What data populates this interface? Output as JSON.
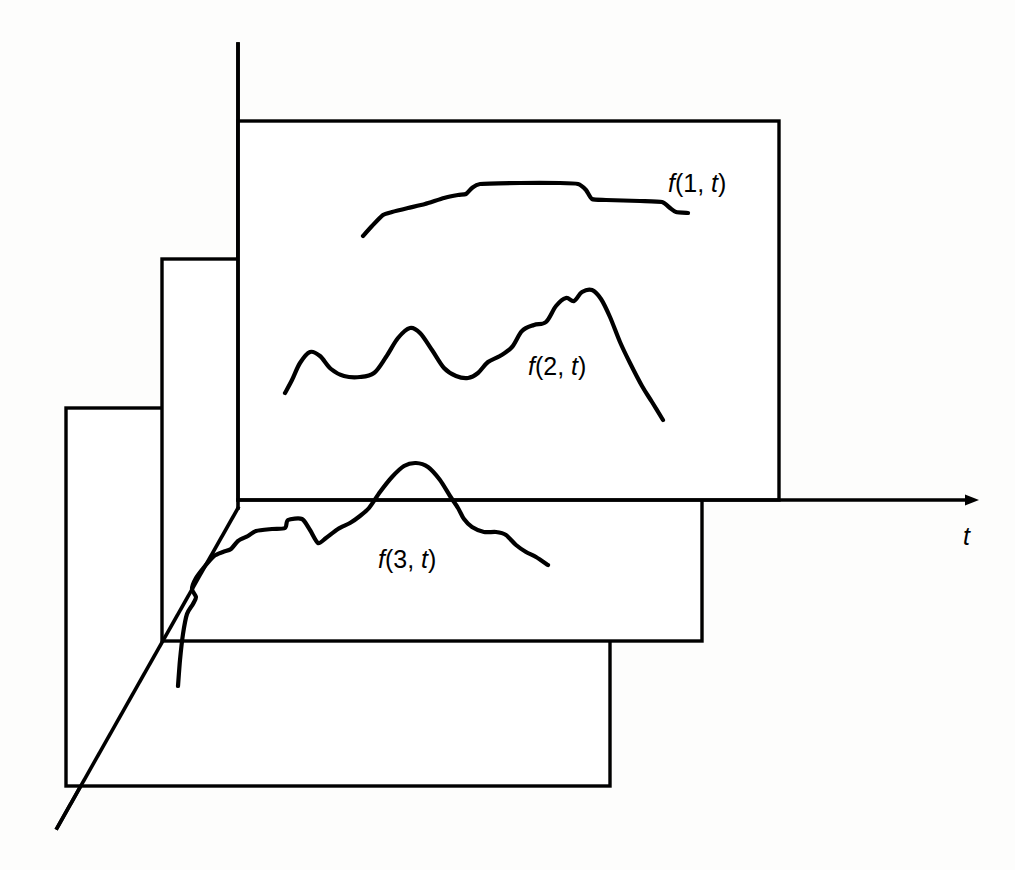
{
  "figure": {
    "title": "",
    "background_color": "#fdfdfc",
    "stroke_color": "#000000"
  },
  "axes": {
    "time_axis": {
      "name": "t",
      "label": "t",
      "label_position": {
        "x": 963,
        "y": 545
      },
      "start": {
        "x": 238,
        "y": 500
      },
      "end": {
        "x": 980,
        "y": 500
      },
      "arrow": "right-arrow-icon"
    },
    "vertical_axis": {
      "label": "",
      "start": {
        "x": 238,
        "y": 44
      },
      "end": {
        "x": 238,
        "y": 508
      }
    },
    "depth_axis": {
      "label": "",
      "start": {
        "x": 238,
        "y": 508
      },
      "end": {
        "x": 57,
        "y": 828
      }
    }
  },
  "planes": [
    {
      "name": "plane-1",
      "label": "f(1, t)",
      "label_prefix": "f",
      "label_body": "(1, ",
      "label_var": "t",
      "label_suffix": ")",
      "label_position": {
        "x": 668,
        "y": 192
      },
      "rect": {
        "x": 238,
        "y": 121,
        "width": 541,
        "height": 379
      }
    },
    {
      "name": "plane-2",
      "label": "f(2, t)",
      "label_prefix": "f",
      "label_body": "(2, ",
      "label_var": "t",
      "label_suffix": ")",
      "label_position": {
        "x": 528,
        "y": 375
      },
      "rect": {
        "x": 162,
        "y": 259,
        "width": 540,
        "height": 382
      }
    },
    {
      "name": "plane-3",
      "label": "f(3, t)",
      "label_prefix": "f",
      "label_body": "(3, ",
      "label_var": "t",
      "label_suffix": ")",
      "label_position": {
        "x": 378,
        "y": 568
      },
      "rect": {
        "x": 66,
        "y": 408,
        "width": 544,
        "height": 378
      }
    }
  ],
  "chart_data": {
    "type": "line",
    "title": "",
    "xlabel": "t",
    "ylabel": "",
    "grid": false,
    "legend": false,
    "series": [
      {
        "name": "f(1, t)",
        "baseline_y": 500,
        "points": [
          [
            363,
            236
          ],
          [
            372,
            226
          ],
          [
            383,
            215
          ],
          [
            392,
            212
          ],
          [
            408,
            208
          ],
          [
            425,
            204
          ],
          [
            444,
            198
          ],
          [
            458,
            195
          ],
          [
            466,
            194
          ],
          [
            472,
            188
          ],
          [
            480,
            184
          ],
          [
            520,
            183
          ],
          [
            560,
            183
          ],
          [
            578,
            184
          ],
          [
            586,
            190
          ],
          [
            592,
            199
          ],
          [
            606,
            200
          ],
          [
            640,
            201
          ],
          [
            662,
            202
          ],
          [
            670,
            208
          ],
          [
            676,
            212
          ],
          [
            688,
            213
          ]
        ]
      },
      {
        "name": "f(2, t)",
        "baseline_y": 500,
        "points": [
          [
            285,
            393
          ],
          [
            292,
            380
          ],
          [
            300,
            363
          ],
          [
            310,
            352
          ],
          [
            320,
            356
          ],
          [
            331,
            369
          ],
          [
            344,
            376
          ],
          [
            360,
            377
          ],
          [
            374,
            373
          ],
          [
            386,
            357
          ],
          [
            398,
            338
          ],
          [
            410,
            328
          ],
          [
            420,
            333
          ],
          [
            432,
            350
          ],
          [
            444,
            368
          ],
          [
            456,
            376
          ],
          [
            468,
            378
          ],
          [
            478,
            373
          ],
          [
            488,
            362
          ],
          [
            500,
            356
          ],
          [
            512,
            347
          ],
          [
            522,
            331
          ],
          [
            534,
            325
          ],
          [
            546,
            322
          ],
          [
            556,
            306
          ],
          [
            566,
            298
          ],
          [
            574,
            301
          ],
          [
            582,
            292
          ],
          [
            592,
            290
          ],
          [
            601,
            299
          ],
          [
            610,
            317
          ],
          [
            620,
            342
          ],
          [
            630,
            363
          ],
          [
            642,
            386
          ],
          [
            652,
            402
          ],
          [
            663,
            420
          ]
        ]
      },
      {
        "name": "f(3, t)",
        "baseline_y": 508,
        "points": [
          [
            178,
            686
          ],
          [
            180,
            660
          ],
          [
            183,
            634
          ],
          [
            187,
            614
          ],
          [
            193,
            604
          ],
          [
            196,
            597
          ],
          [
            192,
            589
          ],
          [
            196,
            578
          ],
          [
            205,
            566
          ],
          [
            214,
            556
          ],
          [
            223,
            552
          ],
          [
            231,
            549
          ],
          [
            238,
            541
          ],
          [
            248,
            536
          ],
          [
            256,
            531
          ],
          [
            272,
            529
          ],
          [
            285,
            528
          ],
          [
            288,
            520
          ],
          [
            302,
            519
          ],
          [
            310,
            530
          ],
          [
            318,
            543
          ],
          [
            326,
            538
          ],
          [
            338,
            529
          ],
          [
            350,
            523
          ],
          [
            360,
            516
          ],
          [
            369,
            508
          ],
          [
            380,
            492
          ],
          [
            392,
            477
          ],
          [
            404,
            466
          ],
          [
            416,
            463
          ],
          [
            428,
            467
          ],
          [
            440,
            480
          ],
          [
            450,
            496
          ],
          [
            458,
            508
          ],
          [
            464,
            519
          ],
          [
            472,
            527
          ],
          [
            484,
            532
          ],
          [
            496,
            532
          ],
          [
            506,
            535
          ],
          [
            516,
            545
          ],
          [
            526,
            552
          ],
          [
            536,
            557
          ],
          [
            548,
            565
          ]
        ]
      }
    ]
  }
}
